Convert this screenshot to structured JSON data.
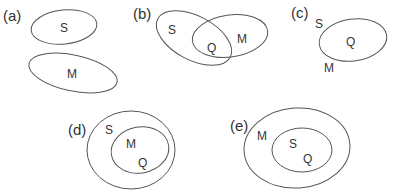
{
  "panels": [
    {
      "id": "a",
      "label": "(a)",
      "sets": [
        "S",
        "M"
      ],
      "relation": "disjoint"
    },
    {
      "id": "b",
      "label": "(b)",
      "sets": [
        "S",
        "Q",
        "M"
      ],
      "relation": "S and M overlap; Q is the intersection"
    },
    {
      "id": "c",
      "label": "(c)",
      "sets": [
        "S",
        "Q",
        "M"
      ],
      "relation": "S, Q and M coincide (single region)"
    },
    {
      "id": "d",
      "label": "(d)",
      "sets": [
        "S",
        "M",
        "Q"
      ],
      "relation": "M = Q contained within S"
    },
    {
      "id": "e",
      "label": "(e)",
      "sets": [
        "M",
        "S",
        "Q"
      ],
      "relation": "S = Q contained within M"
    }
  ],
  "text": {
    "a": {
      "panel": "(a)",
      "s": "S",
      "m": "M"
    },
    "b": {
      "panel": "(b)",
      "s": "S",
      "q": "Q",
      "m": "M"
    },
    "c": {
      "panel": "(c)",
      "s": "S",
      "q": "Q",
      "m": "M"
    },
    "d": {
      "panel": "(d)",
      "s": "S",
      "m": "M",
      "q": "Q"
    },
    "e": {
      "panel": "(e)",
      "m": "M",
      "s": "S",
      "q": "Q"
    }
  },
  "colors": {
    "stroke": "#555555",
    "text": "#333333",
    "background": "#ffffff"
  }
}
